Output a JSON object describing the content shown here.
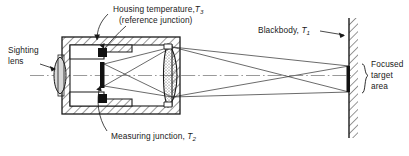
{
  "figure": {
    "type": "cross-section-diagram",
    "background_color": "#ffffff",
    "line_color": "#1a1a1a"
  },
  "labels": {
    "housing_temperature": {
      "line1": "Housing temperature,",
      "symbol": "T",
      "subscript": "3",
      "line2": "(reference junction)"
    },
    "sighting_lens": {
      "line1": "Sighting",
      "line2": "lens"
    },
    "measuring_junction": {
      "text": "Measuring junction,",
      "symbol": "T",
      "subscript": "2"
    },
    "blackbody": {
      "text": "Blackbody,",
      "symbol": "T",
      "subscript": "1"
    },
    "focused_target_area": {
      "line1": "Focused",
      "line2": "target",
      "line3": "area"
    }
  },
  "components": {
    "housing": "hatched sectioned instrument housing",
    "sighting_lens": "eyepiece lens at left",
    "objective_lens": "stippled biconvex objective lens at right of housing",
    "detector": "black vertical measuring junction strip",
    "reference_junction_block": "black block on housing inner wall",
    "blackbody_wall": "hatched vertical wall at right",
    "target_strip": "solid black focused target area on wall",
    "optical_axis": "horizontal dash-dot centerline",
    "rays": "straight ray bundle from target through lens to detector"
  }
}
